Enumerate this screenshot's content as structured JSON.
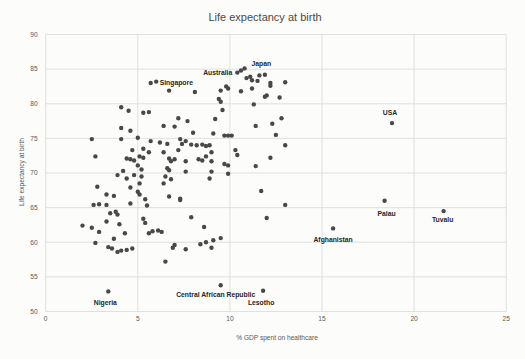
{
  "chart_data": {
    "type": "scatter",
    "title": "Life expectancy at birth",
    "xlabel": "% GDP spent on healthcare",
    "ylabel": "Life expectancy at birth",
    "xlim": [
      0,
      25
    ],
    "ylim": [
      50,
      90
    ],
    "x_ticks": [
      0,
      5,
      10,
      15,
      20,
      25
    ],
    "y_ticks": [
      50,
      55,
      60,
      65,
      70,
      75,
      80,
      85,
      90
    ],
    "grid": true,
    "legend": false,
    "colors": {
      "point": "#484848",
      "grid": "#dcdcdc",
      "tick_text": "#595959",
      "title_text": "#4a4a4a",
      "label_text": "#262626",
      "background": "#fcfcfb"
    },
    "labeled_points": [
      {
        "name": "Singapore",
        "x": 5.7,
        "y": 83.0,
        "anchor": "start",
        "dx": 9,
        "dy": 0
      },
      {
        "name": "Australia",
        "x": 10.4,
        "y": 84.5,
        "anchor": "end",
        "dx": -5,
        "dy": 0
      },
      {
        "name": "Japan",
        "x": 11.6,
        "y": 84.1,
        "anchor": "middle",
        "dx": 2,
        "dy": -9
      },
      {
        "name": "USA",
        "x": 18.8,
        "y": 77.2,
        "anchor": "middle",
        "dx": -2,
        "dy": -8
      },
      {
        "name": "Palau",
        "x": 18.4,
        "y": 66.0,
        "anchor": "middle",
        "dx": 2,
        "dy": 15
      },
      {
        "name": "Tuvalu",
        "x": 21.6,
        "y": 64.5,
        "anchor": "middle",
        "dx": -1,
        "dy": 11
      },
      {
        "name": "Afghanistan",
        "x": 15.6,
        "y": 62.0,
        "anchor": "middle",
        "dx": 0,
        "dy": 14
      },
      {
        "name": "Nigeria",
        "x": 3.4,
        "y": 52.9,
        "anchor": "middle",
        "dx": -3,
        "dy": 14
      },
      {
        "name": "Central African Republic",
        "x": 9.5,
        "y": 53.8,
        "anchor": "middle",
        "dx": -5,
        "dy": 12
      },
      {
        "name": "Lesotho",
        "x": 11.8,
        "y": 53.0,
        "anchor": "middle",
        "dx": -2,
        "dy": 14
      }
    ],
    "points": [
      [
        6.0,
        83.2
      ],
      [
        4.1,
        79.5
      ],
      [
        4.5,
        79.0
      ],
      [
        5.3,
        78.7
      ],
      [
        5.6,
        78.8
      ],
      [
        4.1,
        76.5
      ],
      [
        4.6,
        76.1
      ],
      [
        2.5,
        74.9
      ],
      [
        4.1,
        74.9
      ],
      [
        2.7,
        72.4
      ],
      [
        4.4,
        72.1
      ],
      [
        3.9,
        69.7
      ],
      [
        4.2,
        70.3
      ],
      [
        6.7,
        81.9
      ],
      [
        7.2,
        77.9
      ],
      [
        7.7,
        77.5
      ],
      [
        6.4,
        76.8
      ],
      [
        7.0,
        76.7
      ],
      [
        8.0,
        75.8
      ],
      [
        9.1,
        75.7
      ],
      [
        5.0,
        75.1
      ],
      [
        5.7,
        74.6
      ],
      [
        6.2,
        74.4
      ],
      [
        6.6,
        74.2
      ],
      [
        7.3,
        74.9
      ],
      [
        7.4,
        74.2
      ],
      [
        7.6,
        74.6
      ],
      [
        7.9,
        74.1
      ],
      [
        8.2,
        74.0
      ],
      [
        8.5,
        74.1
      ],
      [
        8.7,
        73.9
      ],
      [
        8.9,
        74.0
      ],
      [
        5.3,
        73.5
      ],
      [
        4.7,
        73.3
      ],
      [
        5.6,
        73.0
      ],
      [
        6.4,
        73.0
      ],
      [
        7.2,
        73.3
      ],
      [
        9.0,
        73.0
      ],
      [
        5.1,
        72.4
      ],
      [
        5.3,
        72.2
      ],
      [
        4.6,
        72.0
      ],
      [
        4.8,
        71.8
      ],
      [
        6.7,
        72.1
      ],
      [
        6.8,
        71.7
      ],
      [
        7.0,
        72.0
      ],
      [
        7.6,
        71.7
      ],
      [
        8.3,
        72.0
      ],
      [
        8.5,
        71.8
      ],
      [
        9.0,
        71.7
      ],
      [
        5.0,
        71.1
      ],
      [
        5.2,
        70.5
      ],
      [
        6.6,
        70.7
      ],
      [
        6.7,
        70.4
      ],
      [
        7.6,
        70.2
      ],
      [
        6.5,
        69.5
      ],
      [
        6.8,
        69.1
      ],
      [
        4.8,
        69.7
      ],
      [
        5.2,
        69.5
      ],
      [
        4.4,
        69.2
      ],
      [
        5.1,
        68.5
      ],
      [
        6.4,
        68.5
      ],
      [
        5.0,
        67.3
      ],
      [
        4.6,
        67.9
      ],
      [
        6.7,
        66.6
      ],
      [
        7.3,
        66.3
      ],
      [
        5.4,
        66.2
      ],
      [
        5.5,
        65.3
      ],
      [
        5.1,
        66.9
      ],
      [
        10.6,
        84.8
      ],
      [
        10.8,
        85.1
      ],
      [
        11.1,
        83.9
      ],
      [
        11.9,
        84.2
      ],
      [
        11.2,
        83.4
      ],
      [
        11.5,
        83.3
      ],
      [
        12.2,
        83.0
      ],
      [
        13.0,
        83.1
      ],
      [
        12.2,
        82.6
      ],
      [
        10.9,
        83.7
      ],
      [
        9.5,
        81.9
      ],
      [
        9.8,
        82.5
      ],
      [
        9.9,
        82.2
      ],
      [
        10.6,
        81.8
      ],
      [
        11.2,
        82.2
      ],
      [
        12.0,
        81.2
      ],
      [
        12.7,
        80.9
      ],
      [
        9.4,
        80.7
      ],
      [
        9.5,
        80.3
      ],
      [
        11.3,
        79.9
      ],
      [
        11.9,
        81.0
      ],
      [
        9.2,
        77.8
      ],
      [
        9.6,
        79.1
      ],
      [
        8.1,
        81.7
      ],
      [
        9.7,
        75.4
      ],
      [
        9.9,
        75.4
      ],
      [
        10.1,
        75.4
      ],
      [
        10.3,
        73.3
      ],
      [
        11.4,
        76.8
      ],
      [
        12.3,
        77.1
      ],
      [
        12.5,
        75.5
      ],
      [
        12.8,
        77.9
      ],
      [
        13.0,
        74.0
      ],
      [
        9.7,
        71.3
      ],
      [
        9.9,
        71.1
      ],
      [
        10.4,
        72.6
      ],
      [
        11.4,
        71.0
      ],
      [
        12.2,
        72.2
      ],
      [
        9.9,
        69.9
      ],
      [
        8.9,
        69.2
      ],
      [
        9.0,
        70.2
      ],
      [
        8.7,
        72.4
      ],
      [
        2.8,
        68.0
      ],
      [
        3.3,
        66.9
      ],
      [
        2.9,
        65.5
      ],
      [
        2.6,
        65.4
      ],
      [
        3.3,
        65.4
      ],
      [
        3.7,
        66.7
      ],
      [
        4.6,
        65.6
      ],
      [
        3.5,
        64.2
      ],
      [
        3.8,
        64.4
      ],
      [
        3.9,
        64.0
      ],
      [
        5.3,
        63.4
      ],
      [
        5.4,
        62.8
      ],
      [
        2.0,
        62.4
      ],
      [
        2.5,
        62.1
      ],
      [
        2.9,
        61.5
      ],
      [
        3.3,
        63.0
      ],
      [
        4.0,
        62.6
      ],
      [
        4.3,
        61.3
      ],
      [
        2.7,
        59.9
      ],
      [
        3.7,
        60.5
      ],
      [
        5.6,
        61.3
      ],
      [
        5.8,
        61.6
      ],
      [
        6.1,
        61.7
      ],
      [
        6.3,
        61.5
      ],
      [
        3.4,
        59.3
      ],
      [
        3.6,
        59.1
      ],
      [
        3.9,
        58.6
      ],
      [
        4.1,
        58.8
      ],
      [
        4.4,
        58.9
      ],
      [
        4.7,
        59.1
      ],
      [
        6.9,
        59.2
      ],
      [
        6.5,
        57.2
      ],
      [
        7.3,
        66.1
      ],
      [
        7.9,
        63.6
      ],
      [
        8.6,
        62.2
      ],
      [
        8.4,
        59.7
      ],
      [
        8.7,
        60.0
      ],
      [
        9.0,
        59.2
      ],
      [
        7.6,
        59.0
      ],
      [
        9.5,
        60.6
      ],
      [
        9.1,
        60.3
      ],
      [
        7.0,
        59.6
      ],
      [
        11.7,
        67.4
      ],
      [
        13.0,
        65.4
      ],
      [
        12.0,
        63.5
      ]
    ]
  }
}
